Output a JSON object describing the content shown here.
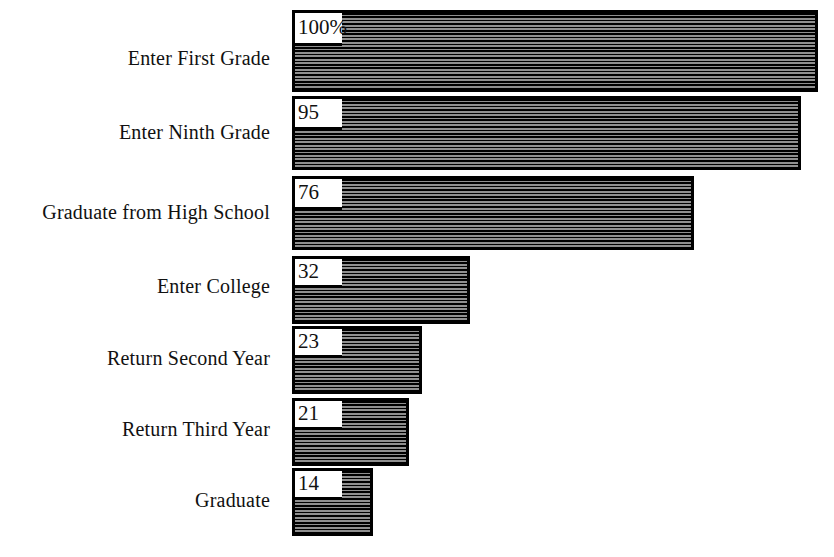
{
  "chart_data": {
    "type": "bar",
    "orientation": "horizontal",
    "title": "",
    "subtitle": "",
    "xlabel": "",
    "ylabel": "",
    "grid": false,
    "legend": null,
    "xlim": [
      0,
      100
    ],
    "unit": "percent",
    "categories": [
      "Enter First Grade",
      "Enter Ninth Grade",
      "Graduate from High School",
      "Enter College",
      "Return Second Year",
      "Return Third Year",
      "Graduate"
    ],
    "values": [
      100,
      95,
      76,
      32,
      23,
      21,
      14
    ],
    "value_labels": [
      "100%",
      "95",
      "76",
      "32",
      "23",
      "21",
      "14"
    ],
    "series": [
      {
        "name": "Percent remaining",
        "values": [
          100,
          95,
          76,
          32,
          23,
          21,
          14
        ]
      }
    ],
    "colors": {
      "bar_fill": "#5a5a5a",
      "bar_hatch": "#000000",
      "bar_border": "#000000",
      "text": "#111111",
      "background": "#ffffff"
    }
  },
  "bars": [
    {
      "label": "Enter First Grade",
      "value_label": "100%",
      "top": 10,
      "height": 82,
      "left": 292,
      "width": 526,
      "notch_width": 50,
      "notch_height": 36,
      "label_y": 60
    },
    {
      "label": "Enter Ninth Grade",
      "value_label": "95",
      "top": 96,
      "height": 74,
      "left": 292,
      "width": 509,
      "notch_width": 50,
      "notch_height": 34,
      "label_y": 134
    },
    {
      "label": "Graduate from High School",
      "value_label": "76",
      "top": 176,
      "height": 74,
      "left": 292,
      "width": 402,
      "notch_width": 50,
      "notch_height": 34,
      "label_y": 214
    },
    {
      "label": "Enter College",
      "value_label": "32",
      "top": 256,
      "height": 68,
      "left": 292,
      "width": 178,
      "notch_width": 50,
      "notch_height": 32,
      "label_y": 288
    },
    {
      "label": "Return Second Year",
      "value_label": "23",
      "top": 326,
      "height": 68,
      "left": 292,
      "width": 130,
      "notch_width": 50,
      "notch_height": 32,
      "label_y": 360
    },
    {
      "label": "Return Third Year",
      "value_label": "21",
      "top": 398,
      "height": 68,
      "left": 292,
      "width": 117,
      "notch_width": 50,
      "notch_height": 32,
      "label_y": 431
    },
    {
      "label": "Graduate",
      "value_label": "14",
      "top": 468,
      "height": 68,
      "left": 292,
      "width": 81,
      "notch_width": 50,
      "notch_height": 32,
      "label_y": 502
    }
  ]
}
